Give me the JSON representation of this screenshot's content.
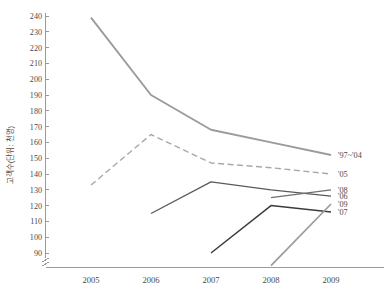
{
  "chart_data": {
    "type": "line",
    "title": "",
    "xlabel": "",
    "ylabel": "고객수(단위: 천명)",
    "categories": [
      "2005",
      "2006",
      "2007",
      "2008",
      "2009"
    ],
    "x": [
      2005,
      2006,
      2007,
      2008,
      2009
    ],
    "ylim": [
      85,
      240
    ],
    "yticks": [
      90,
      100,
      110,
      120,
      130,
      140,
      150,
      160,
      170,
      180,
      190,
      200,
      210,
      220,
      230,
      240
    ],
    "ytick_labels": [
      "90",
      "100",
      "110",
      "120",
      "130",
      "140",
      "150",
      "160",
      "170",
      "180",
      "190",
      "200",
      "210",
      "220",
      "230",
      "240"
    ],
    "grid": false,
    "axis_break": true,
    "legend_position": "right-inline",
    "series": [
      {
        "name": "'97~'04",
        "label": "'97~'04",
        "style": "solid",
        "color": "#9b9b9b",
        "width": 1.9,
        "x": [
          2005,
          2006,
          2007,
          2008,
          2009
        ],
        "values": [
          239,
          190,
          168,
          160,
          152
        ]
      },
      {
        "name": "'05",
        "label": "'05",
        "style": "dashed",
        "color": "#a8a8a8",
        "width": 1.4,
        "x": [
          2005,
          2006,
          2007,
          2008,
          2009
        ],
        "values": [
          133,
          165,
          147,
          144,
          140
        ]
      },
      {
        "name": "'06",
        "label": "'06",
        "style": "solid",
        "color": "#5a5a5a",
        "width": 1.3,
        "x": [
          2006,
          2007,
          2008,
          2009
        ],
        "values": [
          115,
          135,
          130,
          126
        ]
      },
      {
        "name": "'07",
        "label": "'07",
        "style": "solid",
        "color": "#3c3c3c",
        "width": 1.5,
        "x": [
          2007,
          2008,
          2009
        ],
        "values": [
          90,
          120,
          116
        ]
      },
      {
        "name": "'08",
        "label": "'08",
        "style": "solid",
        "color": "#6e6e6e",
        "width": 1.3,
        "x": [
          2008,
          2009
        ],
        "values": [
          125,
          130
        ]
      },
      {
        "name": "'09",
        "label": "'09",
        "style": "solid",
        "color": "#9b9b9b",
        "width": 1.7,
        "x": [
          2008,
          2009
        ],
        "values": [
          82,
          121
        ]
      }
    ],
    "legend_entries": [
      {
        "label": "'97~'04",
        "y_value": 152
      },
      {
        "label": "'05",
        "y_value": 140
      },
      {
        "label": "'08",
        "y_value": 130
      },
      {
        "label": "'06",
        "y_value": 126
      },
      {
        "label": "'09",
        "y_value": 121
      },
      {
        "label": "'07",
        "y_value": 116
      }
    ]
  }
}
